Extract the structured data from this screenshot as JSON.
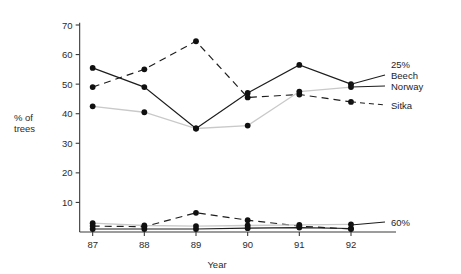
{
  "chart_data": {
    "type": "line",
    "title": "",
    "xlabel": "Year",
    "ylabel": "% of trees",
    "ylabel_line1": "% of",
    "ylabel_line2": "trees",
    "categories": [
      "87",
      "88",
      "89",
      "90",
      "91",
      "92"
    ],
    "x": [
      87,
      88,
      89,
      90,
      91,
      92
    ],
    "xlim": [
      86.6,
      92.6
    ],
    "ylim": [
      0,
      70
    ],
    "yticks": [
      10,
      20,
      30,
      40,
      50,
      60,
      70
    ],
    "ytick_labels": [
      "10",
      "20",
      "30",
      "40",
      "50",
      "60",
      "70"
    ],
    "xticks": [
      87,
      88,
      89,
      90,
      91,
      92
    ],
    "xtick_labels": [
      "87",
      "88",
      "89",
      "90",
      "91",
      "92"
    ],
    "grid": false,
    "legend_position": "right",
    "group_labels": {
      "upper": "25%",
      "lower": "60%"
    },
    "series": [
      {
        "name": "Beech",
        "group": "25%",
        "style": "solid",
        "color": "#1d1d1d",
        "values": [
          55.5,
          49.0,
          35.0,
          47.0,
          56.5,
          50.0
        ]
      },
      {
        "name": "Norway",
        "group": "25%",
        "style": "dashed",
        "color": "#1d1d1d",
        "values": [
          49.0,
          55.0,
          64.5,
          45.5,
          46.5,
          44.0
        ]
      },
      {
        "name": "Sitka",
        "group": "25%",
        "style": "light",
        "color": "#c9c9c9",
        "values": [
          42.5,
          40.5,
          35.0,
          36.0,
          47.5,
          49.0
        ]
      },
      {
        "name": "Beech",
        "group": "60%",
        "style": "solid",
        "color": "#1d1d1d",
        "values": [
          1.0,
          1.0,
          1.0,
          1.3,
          1.5,
          1.2
        ]
      },
      {
        "name": "Norway",
        "group": "60%",
        "style": "dashed",
        "color": "#1d1d1d",
        "values": [
          2.0,
          1.8,
          6.5,
          4.0,
          2.0,
          1.0
        ]
      },
      {
        "name": "Sitka",
        "group": "60%",
        "style": "light",
        "color": "#c9c9c9",
        "values": [
          3.0,
          2.2,
          2.0,
          2.2,
          2.4,
          2.6
        ]
      }
    ],
    "legend_entries": [
      {
        "label": "25%"
      },
      {
        "label": "Beech"
      },
      {
        "label": "Norway"
      },
      {
        "label": "Sitka"
      },
      {
        "label": "60%"
      }
    ]
  }
}
